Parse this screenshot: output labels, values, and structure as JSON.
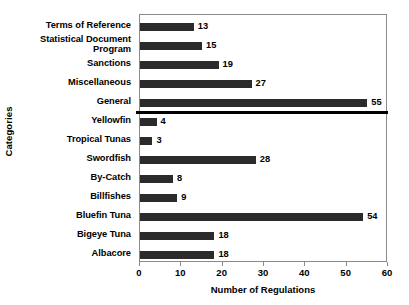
{
  "chart_data": {
    "type": "bar",
    "orientation": "horizontal",
    "title": "",
    "xlabel": "Number of Regulations",
    "ylabel": "Categories",
    "xlim": [
      0,
      60
    ],
    "xticks": [
      0,
      10,
      20,
      30,
      40,
      50,
      60
    ],
    "xtick_labels": [
      "0",
      "10",
      "20",
      "30",
      "40",
      "50",
      "60"
    ],
    "grid": false,
    "legend": null,
    "bar_color": "#2b2b2b",
    "frame_color": "#8a8a8a",
    "show_value_labels": true,
    "categories": [
      "Terms of Reference",
      "Statistical Document\nProgram",
      "Sanctions",
      "Miscellaneous",
      "General",
      "Yellowfin",
      "Tropical Tunas",
      "Swordfish",
      "By-Catch",
      "Billfishes",
      "Bluefin Tuna",
      "Bigeye Tuna",
      "Albacore"
    ],
    "values": [
      13,
      15,
      19,
      27,
      55,
      4,
      3,
      28,
      8,
      9,
      54,
      18,
      18
    ],
    "value_labels": [
      "13",
      "15",
      "19",
      "27",
      "55",
      "4",
      "3",
      "28",
      "8",
      "9",
      "54",
      "18",
      "18"
    ],
    "annotations": [
      {
        "type": "divider-line",
        "description": "thick horizontal rule separating General from Yellowfin",
        "after_category_index": 4
      }
    ]
  }
}
